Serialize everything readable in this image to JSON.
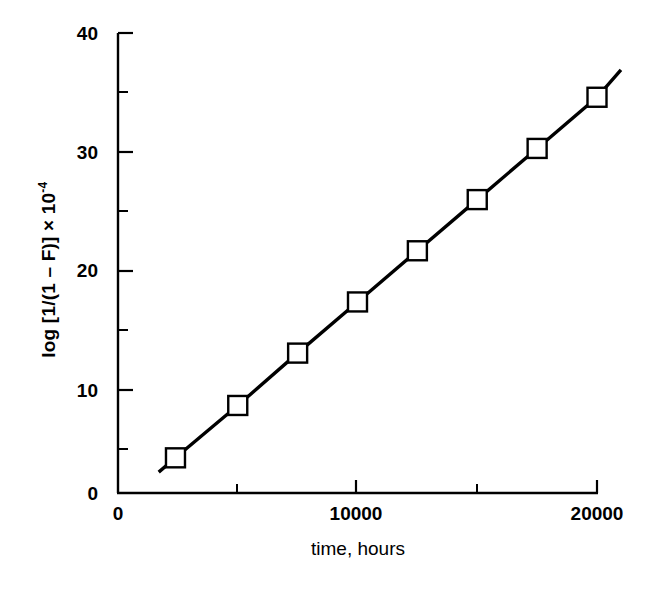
{
  "chart_data": {
    "type": "line",
    "title": "",
    "subtitle": "",
    "xlabel": "time, hours",
    "ylabel": "log [1/(1 – F)] × 10",
    "ylabel_exponent": "-4",
    "ylabel_plain": "log [1/(1 – F)] × 10⁻⁴",
    "xlim": [
      0,
      21000
    ],
    "ylim": [
      0,
      40
    ],
    "x_major_ticks": [
      0,
      10000,
      20000
    ],
    "x_minor_ticks": [
      5000,
      15000
    ],
    "x_tick_labels": [
      "0",
      "10000",
      "20000"
    ],
    "y_major_ticks": [
      0,
      10,
      20,
      30,
      40
    ],
    "y_minor_ticks": [
      5,
      15,
      25,
      35
    ],
    "y_tick_labels": [
      "0",
      "10",
      "20",
      "30",
      "40"
    ],
    "grid": false,
    "legend": false,
    "legend_position": "none",
    "marker": "open-square",
    "line_color": "#000000",
    "marker_face_color": "#ffffff",
    "marker_edge_color": "#000000",
    "x": [
      2400,
      5000,
      7500,
      10000,
      12500,
      15000,
      17500,
      20000
    ],
    "values": [
      4.3,
      8.7,
      13.1,
      17.4,
      21.7,
      26.0,
      30.3,
      34.6
    ],
    "line_extension": {
      "x_start": 1700,
      "y_start": 3.1,
      "x_end": 21000,
      "y_end": 36.9
    },
    "series": [
      {
        "name": "failure data",
        "x": [
          2400,
          5000,
          7500,
          10000,
          12500,
          15000,
          17500,
          20000
        ],
        "values": [
          4.3,
          8.7,
          13.1,
          17.4,
          21.7,
          26.0,
          30.3,
          34.6
        ]
      }
    ],
    "annotations": []
  }
}
